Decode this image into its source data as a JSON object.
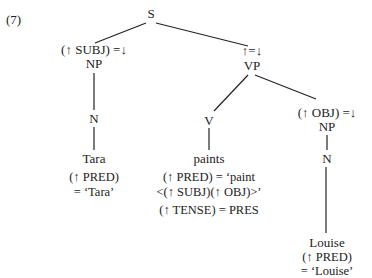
{
  "example_number": "(7)",
  "nodes": {
    "s": "S",
    "np_subj_annot": "(↑ SUBJ) =↓",
    "np_subj": "NP",
    "n_subj": "N",
    "tara": "Tara",
    "tara_pred1": "(↑ PRED)",
    "tara_pred2": "= ‘Tara’",
    "vp_annot": "↑=↓",
    "vp": "VP",
    "v": "V",
    "paints": "paints",
    "paints_pred1": "(↑ PRED) = ‘paint",
    "paints_pred2": "<(↑ SUBJ)(↑ OBJ)>’",
    "paints_tense": "(↑ TENSE) = PRES",
    "np_obj_annot": "(↑ OBJ) =↓",
    "np_obj": "NP",
    "n_obj": "N",
    "louise": "Louise",
    "louise_pred1": "(↑ PRED)",
    "louise_pred2": "= ‘Louise’"
  }
}
